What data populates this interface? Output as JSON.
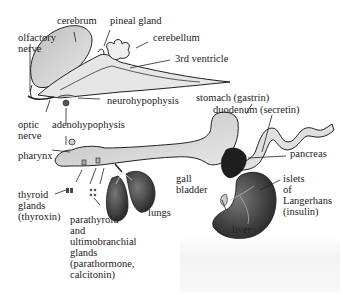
{
  "figure": {
    "type": "anatomical diagram"
  },
  "labels": {
    "cerebrum": "cerebrum",
    "pineal_gland": "pineal gland",
    "cerebellum": "cerebellum",
    "olfactory_nerve": "olfactory\nnerve",
    "third_ventricle": "3rd ventricle",
    "neurohypophysis": "neurohypophysis",
    "optic_nerve": "optic\nnerve",
    "adenohypophysis": "adenohypophysis",
    "stomach": "stomach (gastrin)",
    "duodenum": "duodenum (secretin)",
    "pharynx": "pharynx",
    "pancreas": "pancreas",
    "gall_bladder": "gall\nbladder",
    "islets": "islets\nof\nLangerhans\n(insulin)",
    "thyroid": "thyroid\nglands\n(thyroxin)",
    "lungs": "lungs",
    "liver": "liver",
    "parathyroid": "parathyroid\nand\nultimobranchial\nglands\n(parathormone,\ncalcitonin)"
  },
  "colors": {
    "ink": "#1a1a1a",
    "organ_fill": "#d9d9d9",
    "organ_dark": "#2b2b2b",
    "background": "#ffffff"
  }
}
